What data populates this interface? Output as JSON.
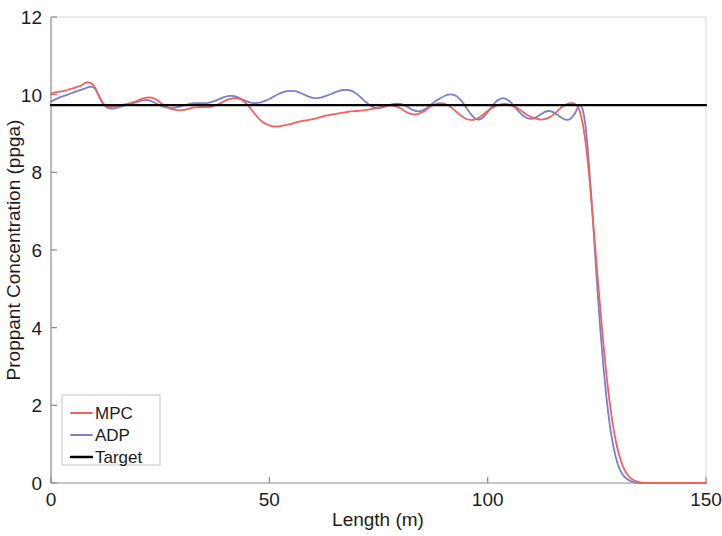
{
  "chart_data": {
    "type": "line",
    "title": "",
    "xlabel": "Length (m)",
    "ylabel": "Proppant Concentration (ppga)",
    "xlim": [
      0,
      150
    ],
    "ylim": [
      0,
      12
    ],
    "xticks": [
      0,
      50,
      100,
      150
    ],
    "yticks": [
      0,
      2,
      4,
      6,
      8,
      10,
      12
    ],
    "xtick_labels": [
      "0",
      "50",
      "100",
      "150"
    ],
    "ytick_labels": [
      "0",
      "2",
      "4",
      "6",
      "8",
      "10",
      "12"
    ],
    "grid": false,
    "legend_position": "lower left",
    "legend_entries": [
      "MPC",
      "ADP",
      "Target"
    ],
    "colors": {
      "MPC": "#f0625a",
      "ADP": "#7b7fd4",
      "Target": "#000000",
      "axis": "#8a8a8a",
      "background": "#ffffff"
    },
    "series": [
      {
        "name": "MPC",
        "color": "#f0625a",
        "width": 1.8,
        "points": [
          [
            0.0,
            10.02
          ],
          [
            1.0,
            10.06
          ],
          [
            2.0,
            10.08
          ],
          [
            3.0,
            10.1
          ],
          [
            4.0,
            10.13
          ],
          [
            5.0,
            10.16
          ],
          [
            6.0,
            10.2
          ],
          [
            7.0,
            10.24
          ],
          [
            7.8,
            10.3
          ],
          [
            8.4,
            10.32
          ],
          [
            9.0,
            10.3
          ],
          [
            9.6,
            10.26
          ],
          [
            10.2,
            10.16
          ],
          [
            10.8,
            10.0
          ],
          [
            11.4,
            9.86
          ],
          [
            12.0,
            9.76
          ],
          [
            12.8,
            9.7
          ],
          [
            13.6,
            9.68
          ],
          [
            14.5,
            9.7
          ],
          [
            15.5,
            9.72
          ],
          [
            16.5,
            9.74
          ],
          [
            17.5,
            9.76
          ],
          [
            18.5,
            9.79
          ],
          [
            19.5,
            9.83
          ],
          [
            20.5,
            9.88
          ],
          [
            21.5,
            9.92
          ],
          [
            22.5,
            9.93
          ],
          [
            23.2,
            9.92
          ],
          [
            24.0,
            9.88
          ],
          [
            25.0,
            9.8
          ],
          [
            26.0,
            9.72
          ],
          [
            27.0,
            9.66
          ],
          [
            28.0,
            9.62
          ],
          [
            29.0,
            9.6
          ],
          [
            30.0,
            9.6
          ],
          [
            31.0,
            9.62
          ],
          [
            32.0,
            9.65
          ],
          [
            33.0,
            9.67
          ],
          [
            34.0,
            9.68
          ],
          [
            35.0,
            9.68
          ],
          [
            36.0,
            9.68
          ],
          [
            37.0,
            9.7
          ],
          [
            38.0,
            9.74
          ],
          [
            39.0,
            9.79
          ],
          [
            40.0,
            9.85
          ],
          [
            41.0,
            9.89
          ],
          [
            42.0,
            9.91
          ],
          [
            43.0,
            9.9
          ],
          [
            44.0,
            9.84
          ],
          [
            45.0,
            9.74
          ],
          [
            46.0,
            9.6
          ],
          [
            47.0,
            9.46
          ],
          [
            48.0,
            9.34
          ],
          [
            49.0,
            9.26
          ],
          [
            50.0,
            9.21
          ],
          [
            51.0,
            9.18
          ],
          [
            52.0,
            9.18
          ],
          [
            53.0,
            9.2
          ],
          [
            54.0,
            9.22
          ],
          [
            55.0,
            9.25
          ],
          [
            56.0,
            9.28
          ],
          [
            57.0,
            9.31
          ],
          [
            58.0,
            9.33
          ],
          [
            59.0,
            9.35
          ],
          [
            60.0,
            9.37
          ],
          [
            61.0,
            9.4
          ],
          [
            62.0,
            9.43
          ],
          [
            63.0,
            9.46
          ],
          [
            64.0,
            9.48
          ],
          [
            65.0,
            9.5
          ],
          [
            66.0,
            9.52
          ],
          [
            67.0,
            9.54
          ],
          [
            68.0,
            9.56
          ],
          [
            69.0,
            9.57
          ],
          [
            70.0,
            9.58
          ],
          [
            71.0,
            9.59
          ],
          [
            72.0,
            9.6
          ],
          [
            73.0,
            9.62
          ],
          [
            74.0,
            9.64
          ],
          [
            75.0,
            9.67
          ],
          [
            76.0,
            9.7
          ],
          [
            77.0,
            9.72
          ],
          [
            78.0,
            9.72
          ],
          [
            79.0,
            9.7
          ],
          [
            80.0,
            9.65
          ],
          [
            81.0,
            9.58
          ],
          [
            82.0,
            9.52
          ],
          [
            83.0,
            9.49
          ],
          [
            84.0,
            9.5
          ],
          [
            85.0,
            9.55
          ],
          [
            86.0,
            9.62
          ],
          [
            87.0,
            9.7
          ],
          [
            88.0,
            9.75
          ],
          [
            89.0,
            9.78
          ],
          [
            90.0,
            9.77
          ],
          [
            91.0,
            9.72
          ],
          [
            92.0,
            9.64
          ],
          [
            93.0,
            9.54
          ],
          [
            94.0,
            9.45
          ],
          [
            95.0,
            9.38
          ],
          [
            96.0,
            9.35
          ],
          [
            97.0,
            9.36
          ],
          [
            98.0,
            9.41
          ],
          [
            99.0,
            9.49
          ],
          [
            100.0,
            9.58
          ],
          [
            101.0,
            9.66
          ],
          [
            102.0,
            9.72
          ],
          [
            103.0,
            9.75
          ],
          [
            104.0,
            9.76
          ],
          [
            105.0,
            9.74
          ],
          [
            106.0,
            9.7
          ],
          [
            107.0,
            9.64
          ],
          [
            108.0,
            9.56
          ],
          [
            109.0,
            9.48
          ],
          [
            110.0,
            9.42
          ],
          [
            111.0,
            9.38
          ],
          [
            112.0,
            9.36
          ],
          [
            113.0,
            9.37
          ],
          [
            114.0,
            9.41
          ],
          [
            115.0,
            9.48
          ],
          [
            116.0,
            9.58
          ],
          [
            117.0,
            9.68
          ],
          [
            118.0,
            9.75
          ],
          [
            119.0,
            9.78
          ],
          [
            120.0,
            9.76
          ],
          [
            120.8,
            9.66
          ],
          [
            121.5,
            9.4
          ],
          [
            122.2,
            8.95
          ],
          [
            123.0,
            8.2
          ],
          [
            123.8,
            7.2
          ],
          [
            124.6,
            6.1
          ],
          [
            125.4,
            5.0
          ],
          [
            126.2,
            3.95
          ],
          [
            127.0,
            3.0
          ],
          [
            127.8,
            2.2
          ],
          [
            128.6,
            1.55
          ],
          [
            129.4,
            1.05
          ],
          [
            130.2,
            0.68
          ],
          [
            131.0,
            0.42
          ],
          [
            131.8,
            0.25
          ],
          [
            132.6,
            0.14
          ],
          [
            133.5,
            0.07
          ],
          [
            134.5,
            0.03
          ],
          [
            135.5,
            0.01
          ],
          [
            137.0,
            0.0
          ],
          [
            140.0,
            0.0
          ],
          [
            145.0,
            0.0
          ],
          [
            150.0,
            0.0
          ]
        ]
      },
      {
        "name": "ADP",
        "color": "#7b7fd4",
        "width": 1.8,
        "points": [
          [
            0.0,
            9.82
          ],
          [
            1.0,
            9.88
          ],
          [
            2.0,
            9.93
          ],
          [
            3.0,
            9.97
          ],
          [
            4.0,
            10.01
          ],
          [
            5.0,
            10.05
          ],
          [
            6.0,
            10.09
          ],
          [
            7.0,
            10.13
          ],
          [
            8.0,
            10.17
          ],
          [
            8.8,
            10.2
          ],
          [
            9.4,
            10.2
          ],
          [
            10.0,
            10.16
          ],
          [
            10.6,
            10.06
          ],
          [
            11.2,
            9.92
          ],
          [
            11.8,
            9.8
          ],
          [
            12.4,
            9.71
          ],
          [
            13.0,
            9.66
          ],
          [
            13.8,
            9.64
          ],
          [
            14.6,
            9.65
          ],
          [
            15.5,
            9.68
          ],
          [
            16.5,
            9.71
          ],
          [
            17.5,
            9.74
          ],
          [
            18.5,
            9.77
          ],
          [
            19.5,
            9.8
          ],
          [
            20.5,
            9.84
          ],
          [
            21.5,
            9.86
          ],
          [
            22.3,
            9.86
          ],
          [
            23.0,
            9.83
          ],
          [
            24.0,
            9.78
          ],
          [
            25.0,
            9.72
          ],
          [
            26.0,
            9.68
          ],
          [
            27.0,
            9.66
          ],
          [
            28.0,
            9.66
          ],
          [
            29.0,
            9.68
          ],
          [
            30.0,
            9.71
          ],
          [
            31.0,
            9.74
          ],
          [
            32.0,
            9.77
          ],
          [
            33.0,
            9.78
          ],
          [
            34.0,
            9.78
          ],
          [
            35.0,
            9.78
          ],
          [
            36.0,
            9.79
          ],
          [
            37.0,
            9.82
          ],
          [
            38.0,
            9.86
          ],
          [
            39.0,
            9.91
          ],
          [
            40.0,
            9.95
          ],
          [
            41.0,
            9.97
          ],
          [
            42.0,
            9.96
          ],
          [
            43.0,
            9.92
          ],
          [
            44.0,
            9.87
          ],
          [
            45.0,
            9.82
          ],
          [
            46.0,
            9.79
          ],
          [
            47.0,
            9.78
          ],
          [
            48.0,
            9.8
          ],
          [
            49.0,
            9.84
          ],
          [
            50.0,
            9.89
          ],
          [
            51.0,
            9.95
          ],
          [
            52.0,
            10.01
          ],
          [
            53.0,
            10.06
          ],
          [
            54.0,
            10.09
          ],
          [
            55.0,
            10.1
          ],
          [
            56.0,
            10.09
          ],
          [
            57.0,
            10.05
          ],
          [
            58.0,
            10.0
          ],
          [
            59.0,
            9.95
          ],
          [
            60.0,
            9.92
          ],
          [
            61.0,
            9.91
          ],
          [
            62.0,
            9.93
          ],
          [
            63.0,
            9.97
          ],
          [
            64.0,
            10.01
          ],
          [
            65.0,
            10.06
          ],
          [
            66.0,
            10.1
          ],
          [
            67.0,
            10.12
          ],
          [
            68.0,
            10.12
          ],
          [
            69.0,
            10.09
          ],
          [
            70.0,
            10.02
          ],
          [
            71.0,
            9.92
          ],
          [
            72.0,
            9.82
          ],
          [
            73.0,
            9.73
          ],
          [
            74.0,
            9.67
          ],
          [
            75.0,
            9.65
          ],
          [
            76.0,
            9.67
          ],
          [
            77.0,
            9.71
          ],
          [
            78.0,
            9.75
          ],
          [
            79.0,
            9.77
          ],
          [
            80.0,
            9.76
          ],
          [
            81.0,
            9.72
          ],
          [
            82.0,
            9.66
          ],
          [
            83.0,
            9.6
          ],
          [
            84.0,
            9.57
          ],
          [
            85.0,
            9.59
          ],
          [
            86.0,
            9.65
          ],
          [
            87.0,
            9.74
          ],
          [
            88.0,
            9.83
          ],
          [
            89.0,
            9.9
          ],
          [
            90.0,
            9.96
          ],
          [
            91.0,
            10.0
          ],
          [
            92.0,
            10.0
          ],
          [
            93.0,
            9.95
          ],
          [
            94.0,
            9.84
          ],
          [
            95.0,
            9.68
          ],
          [
            96.0,
            9.52
          ],
          [
            97.0,
            9.4
          ],
          [
            98.0,
            9.36
          ],
          [
            99.0,
            9.42
          ],
          [
            100.0,
            9.55
          ],
          [
            101.0,
            9.7
          ],
          [
            102.0,
            9.83
          ],
          [
            103.0,
            9.9
          ],
          [
            104.0,
            9.9
          ],
          [
            105.0,
            9.83
          ],
          [
            106.0,
            9.71
          ],
          [
            107.0,
            9.58
          ],
          [
            108.0,
            9.47
          ],
          [
            109.0,
            9.4
          ],
          [
            110.0,
            9.38
          ],
          [
            111.0,
            9.41
          ],
          [
            112.0,
            9.48
          ],
          [
            113.0,
            9.55
          ],
          [
            114.0,
            9.58
          ],
          [
            115.0,
            9.55
          ],
          [
            116.0,
            9.48
          ],
          [
            117.0,
            9.4
          ],
          [
            118.0,
            9.35
          ],
          [
            119.0,
            9.38
          ],
          [
            120.0,
            9.52
          ],
          [
            120.6,
            9.66
          ],
          [
            121.2,
            9.72
          ],
          [
            121.8,
            9.6
          ],
          [
            122.4,
            9.2
          ],
          [
            123.0,
            8.5
          ],
          [
            123.7,
            7.45
          ],
          [
            124.4,
            6.25
          ],
          [
            125.1,
            5.05
          ],
          [
            125.8,
            3.95
          ],
          [
            126.5,
            3.0
          ],
          [
            127.2,
            2.2
          ],
          [
            127.9,
            1.55
          ],
          [
            128.6,
            1.05
          ],
          [
            129.3,
            0.68
          ],
          [
            130.0,
            0.42
          ],
          [
            130.8,
            0.24
          ],
          [
            131.6,
            0.13
          ],
          [
            132.5,
            0.06
          ],
          [
            133.5,
            0.02
          ],
          [
            135.0,
            0.0
          ],
          [
            140.0,
            0.0
          ],
          [
            145.0,
            0.0
          ],
          [
            150.0,
            0.0
          ]
        ]
      },
      {
        "name": "Target",
        "color": "#000000",
        "width": 2.2,
        "points": [
          [
            0.0,
            9.73
          ],
          [
            150.0,
            9.73
          ]
        ]
      }
    ]
  },
  "axes": {
    "x_title": "Length (m)",
    "y_title": "Proppant Concentration (ppga)"
  },
  "legend": {
    "items": [
      {
        "label": "MPC",
        "color": "#f0625a"
      },
      {
        "label": "ADP",
        "color": "#7b7fd4"
      },
      {
        "label": "Target",
        "color": "#000000"
      }
    ]
  }
}
